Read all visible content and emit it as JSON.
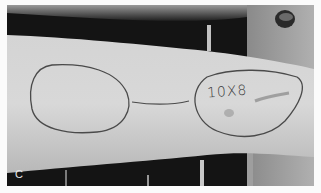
{
  "photo": {
    "description": "Grayscale clinical photograph of a forearm with surgical markings outlining two oval regions connected by a pedicle line",
    "panel_label": "C",
    "annotation_text": "10X8",
    "colors": {
      "frame_background": "#fbfbfb",
      "skin": "#cfcfcf",
      "background_dark": "#151515",
      "background_right": "#9a9a9a",
      "marker_line": "#4a4a4a"
    }
  }
}
